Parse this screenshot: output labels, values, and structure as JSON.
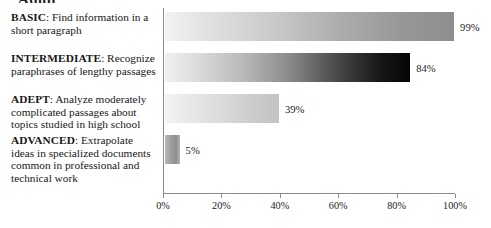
{
  "title_partial": "Adult",
  "chart_data": {
    "type": "bar",
    "orientation": "horizontal",
    "title": "",
    "xlabel": "",
    "ylabel": "",
    "xlim": [
      0,
      100
    ],
    "grid": false,
    "legend": null,
    "categories": [
      "BASIC: Find information in a short paragraph",
      "INTERMEDIATE: Recognize paraphrases of lengthy passages",
      "ADEPT: Analyze moderately complicated passages about topics studied in high school",
      "ADVANCED: Extrapolate ideas in specialized documents common in professional and technical work"
    ],
    "values": [
      99,
      84,
      39,
      5
    ],
    "value_labels": [
      "99%",
      "84%",
      "39%",
      "5%"
    ],
    "xticks": [
      0,
      20,
      40,
      60,
      80,
      100
    ],
    "xticklabels": [
      "0%",
      "20%",
      "40%",
      "60%",
      "80%",
      "100%"
    ],
    "bar_style": "horizontal-bars-with-left-to-right-grayscale-gradient-fill"
  },
  "levels": [
    {
      "tag": "BASIC",
      "desc": "Find information in a short paragraph",
      "value_label": "99%"
    },
    {
      "tag": "INTERMEDIATE",
      "desc": "Recognize paraphrases of lengthy passages",
      "value_label": "84%"
    },
    {
      "tag": "ADEPT",
      "desc": "Analyze moderately complicated passages about topics studied in high school",
      "value_label": "39%"
    },
    {
      "tag": "ADVANCED",
      "desc": "Extrapolate ideas in specialized documents common in professional and technical work",
      "value_label": "5%"
    }
  ],
  "axis": {
    "ticklabels": [
      "0%",
      "20%",
      "40%",
      "60%",
      "80%",
      "100%"
    ]
  }
}
